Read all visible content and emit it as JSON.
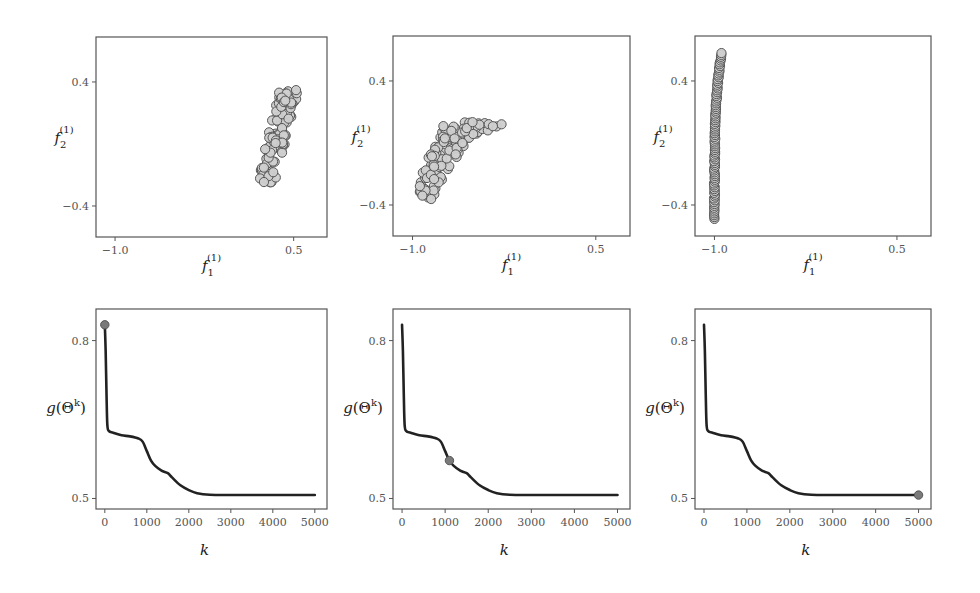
{
  "figure": {
    "width": 980,
    "height": 593,
    "background": "#ffffff",
    "frame_color": "#555555",
    "point_fill": "#cfcfcf",
    "point_stroke": "#555555",
    "line_color": "#222222",
    "marker_fill": "#7a7a7a"
  },
  "chart_data": [
    {
      "type": "scatter",
      "panel": "top-left",
      "title": "",
      "xlabel": "f_1^(1)",
      "ylabel": "f_2^(1)",
      "xticks": [
        -1.0,
        0.5
      ],
      "xtick_labels": [
        "−1.0",
        "0.5"
      ],
      "yticks": [
        0.4,
        -0.4
      ],
      "ytick_labels": [
        "0.4",
        "−0.4"
      ],
      "xlim": [
        -1.16,
        0.78
      ],
      "ylim": [
        -0.6,
        0.69
      ],
      "grid": false,
      "cloud": {
        "shape": "parallelogram",
        "corners": [
          [
            0.19,
            -0.25
          ],
          [
            0.34,
            -0.25
          ],
          [
            0.55,
            0.37
          ],
          [
            0.37,
            0.33
          ]
        ],
        "count": 120
      }
    },
    {
      "type": "scatter",
      "panel": "top-center",
      "title": "",
      "xlabel": "f_1^(1)",
      "ylabel": "f_2^(1)",
      "xticks": [
        -1.0,
        0.5
      ],
      "xtick_labels": [
        "−1.0",
        "0.5"
      ],
      "yticks": [
        0.4,
        -0.4
      ],
      "ytick_labels": [
        "0.4",
        "−0.4"
      ],
      "xlim": [
        -1.16,
        0.78
      ],
      "ylim": [
        -0.6,
        0.69
      ],
      "grid": false,
      "cloud": {
        "shape": "bent-band",
        "corners": [
          [
            -0.95,
            -0.33
          ],
          [
            -0.85,
            -0.37
          ],
          [
            -0.55,
            0.02
          ],
          [
            -0.25,
            0.12
          ],
          [
            -0.73,
            0.15
          ],
          [
            -0.93,
            -0.2
          ]
        ],
        "count": 110
      }
    },
    {
      "type": "scatter",
      "panel": "top-right",
      "title": "",
      "xlabel": "f_1^(1)",
      "ylabel": "f_2^(1)",
      "xticks": [
        -1.0,
        0.5
      ],
      "xtick_labels": [
        "−1.0",
        "0.5"
      ],
      "yticks": [
        0.4,
        -0.4
      ],
      "ytick_labels": [
        "0.4",
        "−0.4"
      ],
      "xlim": [
        -1.16,
        0.78
      ],
      "ylim": [
        -0.6,
        0.69
      ],
      "grid": false,
      "cloud": {
        "shape": "vertical-curve",
        "x_at_bottom": -1.0,
        "x_at_top": -0.94,
        "y_range": [
          -0.49,
          0.58
        ],
        "count": 90
      }
    },
    {
      "type": "line",
      "panel": "bottom-left",
      "title": "",
      "xlabel": "k",
      "ylabel": "g(Θ^k)",
      "xticks": [
        0,
        1000,
        2000,
        3000,
        4000,
        5000
      ],
      "xtick_labels": [
        "0",
        "1000",
        "2000",
        "3000",
        "4000",
        "5000"
      ],
      "yticks": [
        0.8,
        0.5
      ],
      "ytick_labels": [
        "0.8",
        "0.5"
      ],
      "xlim": [
        -210,
        5290
      ],
      "ylim": [
        0.48,
        0.86
      ],
      "grid": false,
      "x": [
        0,
        20,
        40,
        60,
        100,
        200,
        400,
        600,
        800,
        900,
        1000,
        1100,
        1200,
        1350,
        1500,
        1600,
        1800,
        2000,
        2200,
        2500,
        3000,
        4000,
        5000
      ],
      "y": [
        0.83,
        0.78,
        0.7,
        0.64,
        0.628,
        0.625,
        0.62,
        0.618,
        0.614,
        0.608,
        0.59,
        0.572,
        0.562,
        0.553,
        0.548,
        0.54,
        0.525,
        0.516,
        0.51,
        0.507,
        0.5065,
        0.5065,
        0.5065
      ],
      "marker": {
        "k": 0,
        "g": 0.83
      }
    },
    {
      "type": "line",
      "panel": "bottom-center",
      "title": "",
      "xlabel": "k",
      "ylabel": "g(Θ^k)",
      "xticks": [
        0,
        1000,
        2000,
        3000,
        4000,
        5000
      ],
      "xtick_labels": [
        "0",
        "1000",
        "2000",
        "3000",
        "4000",
        "5000"
      ],
      "yticks": [
        0.8,
        0.5
      ],
      "ytick_labels": [
        "0.8",
        "0.5"
      ],
      "xlim": [
        -210,
        5290
      ],
      "ylim": [
        0.48,
        0.86
      ],
      "grid": false,
      "x": [
        0,
        20,
        40,
        60,
        100,
        200,
        400,
        600,
        800,
        900,
        1000,
        1100,
        1200,
        1350,
        1500,
        1600,
        1800,
        2000,
        2200,
        2500,
        3000,
        4000,
        5000
      ],
      "y": [
        0.83,
        0.78,
        0.7,
        0.64,
        0.628,
        0.625,
        0.62,
        0.618,
        0.614,
        0.608,
        0.59,
        0.572,
        0.562,
        0.553,
        0.548,
        0.54,
        0.525,
        0.516,
        0.51,
        0.507,
        0.5065,
        0.5065,
        0.5065
      ],
      "marker": {
        "k": 1100,
        "g": 0.572
      }
    },
    {
      "type": "line",
      "panel": "bottom-right",
      "title": "",
      "xlabel": "k",
      "ylabel": "g(Θ^k)",
      "xticks": [
        0,
        1000,
        2000,
        3000,
        4000,
        5000
      ],
      "xtick_labels": [
        "0",
        "1000",
        "2000",
        "3000",
        "4000",
        "5000"
      ],
      "yticks": [
        0.8,
        0.5
      ],
      "ytick_labels": [
        "0.8",
        "0.5"
      ],
      "xlim": [
        -210,
        5290
      ],
      "ylim": [
        0.48,
        0.86
      ],
      "grid": false,
      "x": [
        0,
        20,
        40,
        60,
        100,
        200,
        400,
        600,
        800,
        900,
        1000,
        1100,
        1200,
        1350,
        1500,
        1600,
        1800,
        2000,
        2200,
        2500,
        3000,
        4000,
        5000
      ],
      "y": [
        0.83,
        0.78,
        0.7,
        0.64,
        0.628,
        0.625,
        0.62,
        0.618,
        0.614,
        0.608,
        0.59,
        0.572,
        0.562,
        0.553,
        0.548,
        0.54,
        0.525,
        0.516,
        0.51,
        0.507,
        0.5065,
        0.5065,
        0.5065
      ],
      "marker": {
        "k": 5000,
        "g": 0.5065
      }
    }
  ],
  "layout": {
    "panels": [
      {
        "left": 96,
        "top": 37,
        "width": 231,
        "height": 200
      },
      {
        "left": 393,
        "top": 36,
        "width": 237,
        "height": 200
      },
      {
        "left": 695,
        "top": 36,
        "width": 236,
        "height": 200
      },
      {
        "left": 96,
        "top": 309,
        "width": 231,
        "height": 200
      },
      {
        "left": 393,
        "top": 309,
        "width": 237,
        "height": 200
      },
      {
        "left": 695,
        "top": 309,
        "width": 236,
        "height": 200
      }
    ]
  }
}
